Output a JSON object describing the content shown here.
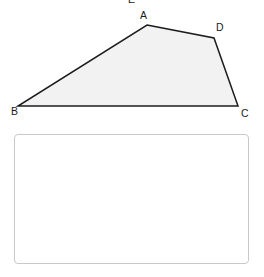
{
  "figure": {
    "type": "quadrilateral",
    "fill_color": "#f2f2f2",
    "stroke_color": "#1c1c1c",
    "stroke_width": 1.5,
    "vertices": [
      {
        "name": "A",
        "x": 147,
        "y": 25
      },
      {
        "name": "D",
        "x": 214,
        "y": 38
      },
      {
        "name": "C",
        "x": 238,
        "y": 106
      },
      {
        "name": "B",
        "x": 18,
        "y": 106
      }
    ],
    "edges": [
      "B-A",
      "A-D",
      "D-C",
      "C-B"
    ],
    "labels": {
      "clipped_top": "E",
      "a": "A",
      "b": "B",
      "c": "C",
      "d": "D"
    }
  },
  "answer_box": {
    "value": "",
    "placeholder": "",
    "border_color": "#c9c9c9",
    "background_color": "#ffffff"
  }
}
